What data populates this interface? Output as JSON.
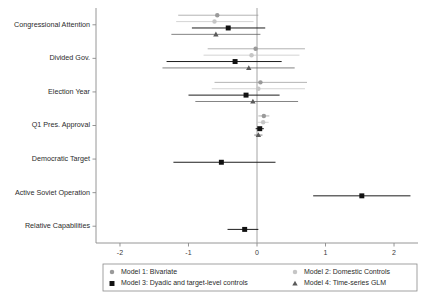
{
  "chart_data": {
    "type": "scatter",
    "subtype": "coefficient-forest-plot",
    "title": "",
    "xlabel": "",
    "ylabel": "",
    "xlim": [
      -2.35,
      2.35
    ],
    "xticks": [
      -2,
      -1,
      0,
      1,
      2
    ],
    "xticklabels": [
      "-2",
      "-1",
      "0",
      "1",
      "2"
    ],
    "grid": false,
    "zero_reference_line": 0,
    "legend_position": "bottom",
    "categories": [
      "Congressional Attention",
      "Divided Gov.",
      "Election Year",
      "Q1 Pres. Approval",
      "Democratic Target",
      "Active Soviet Operation",
      "Relative Capabilities"
    ],
    "series": [
      {
        "name": "Model 1: Bivariate",
        "marker": "circle",
        "color": "#9a9a9a",
        "points": [
          {
            "category": "Congressional Attention",
            "estimate": -0.58,
            "ci_low": -1.15,
            "ci_high": 0.02
          },
          {
            "category": "Divided Gov.",
            "estimate": -0.02,
            "ci_low": -0.72,
            "ci_high": 0.7
          },
          {
            "category": "Election Year",
            "estimate": 0.05,
            "ci_low": -0.62,
            "ci_high": 0.73
          },
          {
            "category": "Q1 Pres. Approval",
            "estimate": 0.1,
            "ci_low": 0.02,
            "ci_high": 0.18
          },
          {
            "category": "Democratic Target",
            "estimate": null,
            "ci_low": null,
            "ci_high": null
          },
          {
            "category": "Active Soviet Operation",
            "estimate": null,
            "ci_low": null,
            "ci_high": null
          },
          {
            "category": "Relative Capabilities",
            "estimate": null,
            "ci_low": null,
            "ci_high": null
          }
        ]
      },
      {
        "name": "Model 2: Domestic Controls",
        "marker": "circle",
        "color": "#c6c6c6",
        "points": [
          {
            "category": "Congressional Attention",
            "estimate": -0.62,
            "ci_low": -1.18,
            "ci_high": -0.05
          },
          {
            "category": "Divided Gov.",
            "estimate": -0.08,
            "ci_low": -0.78,
            "ci_high": 0.62
          },
          {
            "category": "Election Year",
            "estimate": 0.02,
            "ci_low": -0.66,
            "ci_high": 0.7
          },
          {
            "category": "Q1 Pres. Approval",
            "estimate": 0.09,
            "ci_low": 0.01,
            "ci_high": 0.17
          },
          {
            "category": "Democratic Target",
            "estimate": null,
            "ci_low": null,
            "ci_high": null
          },
          {
            "category": "Active Soviet Operation",
            "estimate": null,
            "ci_low": null,
            "ci_high": null
          },
          {
            "category": "Relative Capabilities",
            "estimate": null,
            "ci_low": null,
            "ci_high": null
          }
        ]
      },
      {
        "name": "Model 3: Dyadic and target-level controls",
        "marker": "square",
        "color": "#111111",
        "points": [
          {
            "category": "Congressional Attention",
            "estimate": -0.42,
            "ci_low": -0.95,
            "ci_high": 0.12
          },
          {
            "category": "Divided Gov.",
            "estimate": -0.32,
            "ci_low": -1.32,
            "ci_high": 0.36
          },
          {
            "category": "Election Year",
            "estimate": -0.16,
            "ci_low": -1.0,
            "ci_high": 0.33
          },
          {
            "category": "Q1 Pres. Approval",
            "estimate": 0.04,
            "ci_low": -0.02,
            "ci_high": 0.1
          },
          {
            "category": "Democratic Target",
            "estimate": -0.52,
            "ci_low": -1.22,
            "ci_high": 0.27
          },
          {
            "category": "Active Soviet Operation",
            "estimate": 1.53,
            "ci_low": 0.82,
            "ci_high": 2.24
          },
          {
            "category": "Relative Capabilities",
            "estimate": -0.18,
            "ci_low": -0.43,
            "ci_high": 0.02
          }
        ]
      },
      {
        "name": "Model 4: Time-series GLM",
        "marker": "triangle",
        "color": "#5a5a5a",
        "points": [
          {
            "category": "Congressional Attention",
            "estimate": -0.6,
            "ci_low": -1.25,
            "ci_high": 0.05
          },
          {
            "category": "Divided Gov.",
            "estimate": -0.12,
            "ci_low": -1.38,
            "ci_high": 0.55
          },
          {
            "category": "Election Year",
            "estimate": -0.06,
            "ci_low": -0.9,
            "ci_high": 0.6
          },
          {
            "category": "Q1 Pres. Approval",
            "estimate": 0.02,
            "ci_low": -0.04,
            "ci_high": 0.08
          },
          {
            "category": "Democratic Target",
            "estimate": null,
            "ci_low": null,
            "ci_high": null
          },
          {
            "category": "Active Soviet Operation",
            "estimate": null,
            "ci_low": null,
            "ci_high": null
          },
          {
            "category": "Relative Capabilities",
            "estimate": null,
            "ci_low": null,
            "ci_high": null
          }
        ]
      }
    ]
  },
  "legend": {
    "entries": [
      {
        "label": "Model 1: Bivariate",
        "marker": "circle",
        "color": "#9a9a9a"
      },
      {
        "label": "Model 2: Domestic Controls",
        "marker": "circle",
        "color": "#c6c6c6"
      },
      {
        "label": "Model 3: Dyadic and target-level controls",
        "marker": "square",
        "color": "#111111"
      },
      {
        "label": "Model 4: Time-series GLM",
        "marker": "triangle",
        "color": "#5a5a5a"
      }
    ]
  }
}
